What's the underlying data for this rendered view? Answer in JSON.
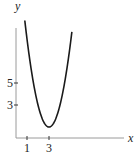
{
  "chart_data": {
    "type": "line",
    "title": "",
    "xlabel": "x",
    "ylabel": "y",
    "x_ticks": [
      "1",
      "3"
    ],
    "y_ticks": [
      "3",
      "5"
    ],
    "series": [
      {
        "name": "parabola",
        "function": "y = 2(x-3)^2 + 1",
        "vertex": [
          3,
          1
        ],
        "x": [
          0.8,
          1.5,
          2,
          2.5,
          3,
          3.5,
          4,
          4.5,
          5.1
        ],
        "values": [
          10.7,
          5.5,
          3,
          1.5,
          1,
          1.5,
          3,
          5.5,
          9.8
        ]
      }
    ],
    "xlim": [
      0,
      11
    ],
    "ylim": [
      0,
      12
    ],
    "grid": false,
    "legend": "none"
  },
  "colors": {
    "axis": "#9a9a9a",
    "curve": "#1a1a1a",
    "text": "#222222"
  }
}
